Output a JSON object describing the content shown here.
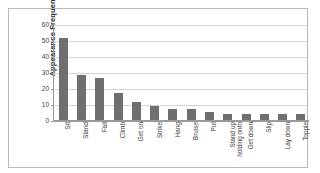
{
  "chart_data": {
    "type": "bar",
    "title": "",
    "xlabel": "",
    "ylabel": "Appearance Frequency",
    "ylim": [
      0,
      60
    ],
    "ytick_values": [
      0,
      10,
      20,
      30,
      40,
      50,
      60
    ],
    "ytick_labels": [
      "0",
      "10",
      "20",
      "30",
      "40",
      "50",
      "60"
    ],
    "grid": true,
    "legend": false,
    "bar_color": "#6f6f6f",
    "categories": [
      "Sit",
      "Stand",
      "Fall",
      "Climb",
      "Get on",
      "Strike",
      "Hang",
      "Bruise",
      "Put",
      "Stand up\nholding onto",
      "Get down",
      "Slip",
      "Lay down",
      "Topple"
    ],
    "values": [
      51,
      28,
      26,
      17,
      11,
      9,
      7,
      7,
      5,
      4,
      4,
      4,
      4,
      4
    ]
  }
}
